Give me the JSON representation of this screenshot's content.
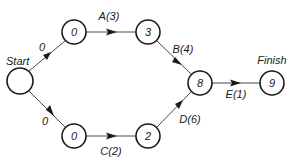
{
  "diagram": {
    "type": "activity-on-arrow network",
    "nodes": [
      {
        "id": "start",
        "value": "",
        "label": "Start",
        "x": 20,
        "y": 81
      },
      {
        "id": "n0top",
        "value": "0",
        "x": 74,
        "y": 32
      },
      {
        "id": "n3",
        "value": "3",
        "x": 148,
        "y": 32
      },
      {
        "id": "n8",
        "value": "8",
        "x": 200,
        "y": 83
      },
      {
        "id": "n9",
        "value": "9",
        "label": "Finish",
        "x": 272,
        "y": 83
      },
      {
        "id": "n0bot",
        "value": "0",
        "x": 74,
        "y": 136
      },
      {
        "id": "n2",
        "value": "2",
        "x": 148,
        "y": 136
      }
    ],
    "edges": [
      {
        "from": "start",
        "to": "n0top",
        "label": "0"
      },
      {
        "from": "n0top",
        "to": "n3",
        "label": "A(3)"
      },
      {
        "from": "n3",
        "to": "n8",
        "label": "B(4)"
      },
      {
        "from": "n8",
        "to": "n9",
        "label": "E(1)"
      },
      {
        "from": "start",
        "to": "n0bot",
        "label": "0"
      },
      {
        "from": "n0bot",
        "to": "n2",
        "label": "C(2)"
      },
      {
        "from": "n2",
        "to": "n8",
        "label": "D(6)"
      }
    ],
    "start_label": "Start",
    "finish_label": "Finish"
  },
  "labels": {
    "start": "Start",
    "finish": "Finish",
    "edge_start_top": "0",
    "edge_A": "A(3)",
    "edge_B": "B(4)",
    "edge_E": "E(1)",
    "edge_start_bottom": "0",
    "edge_C": "C(2)",
    "edge_D": "D(6)"
  },
  "node_values": {
    "start": "",
    "top0": "0",
    "n3": "3",
    "n8": "8",
    "n9": "9",
    "bottom0": "0",
    "n2": "2"
  }
}
